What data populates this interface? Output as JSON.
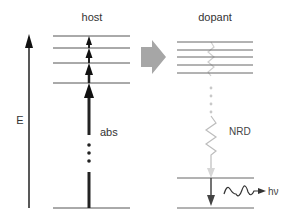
{
  "diagram": {
    "labels": {
      "host": "host",
      "dopant": "dopant",
      "energy_axis": "E",
      "absorption": "abs",
      "nonradiative_decay": "NRD",
      "photon": "hν"
    },
    "host": {
      "level_count": 5,
      "description": "Stacked host energy levels with stepwise upward absorption arrows"
    },
    "dopant": {
      "upper_level_count": 5,
      "lower_level_count": 2,
      "description": "Dopant levels with non-radiative decay then radiative emission"
    },
    "transfer": {
      "description": "Energy transfer arrow from host to dopant"
    },
    "colors": {
      "line": "#555555",
      "arrow_dark": "#222222",
      "transfer_arrow": "#a6a6a6",
      "nrd": "#cccccc"
    }
  }
}
